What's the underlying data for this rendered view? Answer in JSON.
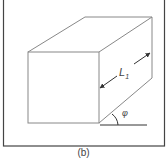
{
  "figure": {
    "caption": "(b)",
    "labels": {
      "length": "L",
      "length_subscript": "1",
      "angle": "φ"
    },
    "colors": {
      "frame": "#444444",
      "lines": "#888888",
      "text": "#444444",
      "background": "#ffffff"
    }
  }
}
